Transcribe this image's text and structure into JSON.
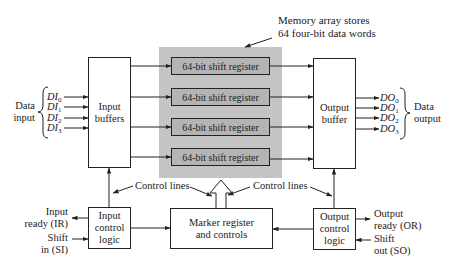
{
  "diagram": {
    "memory_annotation": {
      "line1": "Memory array stores",
      "line2": "64 four-bit data words"
    },
    "input_buffers": {
      "line1": "Input",
      "line2": "buffers"
    },
    "output_buffer": {
      "line1": "Output",
      "line2": "buffer"
    },
    "shift_registers": [
      {
        "label": "64-bit shift register"
      },
      {
        "label": "64-bit shift register"
      },
      {
        "label": "64-bit shift register"
      },
      {
        "label": "64-bit shift register"
      }
    ],
    "data_input": {
      "line1": "Data",
      "line2": "input",
      "signals": [
        {
          "base": "DI",
          "sub": "0"
        },
        {
          "base": "DI",
          "sub": "1"
        },
        {
          "base": "DI",
          "sub": "2"
        },
        {
          "base": "DI",
          "sub": "3"
        }
      ]
    },
    "data_output": {
      "line1": "Data",
      "line2": "output",
      "signals": [
        {
          "base": "DO",
          "sub": "0"
        },
        {
          "base": "DO",
          "sub": "1"
        },
        {
          "base": "DO",
          "sub": "2"
        },
        {
          "base": "DO",
          "sub": "3"
        }
      ]
    },
    "control_lines_left": "Control lines",
    "control_lines_right": "Control lines",
    "input_control_logic": {
      "line1": "Input",
      "line2": "control",
      "line3": "logic"
    },
    "marker_register": {
      "line1": "Marker register",
      "line2": "and controls"
    },
    "output_control_logic": {
      "line1": "Output",
      "line2": "control",
      "line3": "logic"
    },
    "input_ready": {
      "line1": "Input",
      "line2": "ready (IR)"
    },
    "shift_in": {
      "line1": "Shift",
      "line2": "in (SI)"
    },
    "output_ready": {
      "line1": "Output",
      "line2": "ready (OR)"
    },
    "shift_out": {
      "line1": "Shift",
      "line2": "out (SO)"
    }
  },
  "colors": {
    "memory_array_bg": "#c4c4c4",
    "register_bg": "#b4b4b4",
    "line": "#222222"
  }
}
